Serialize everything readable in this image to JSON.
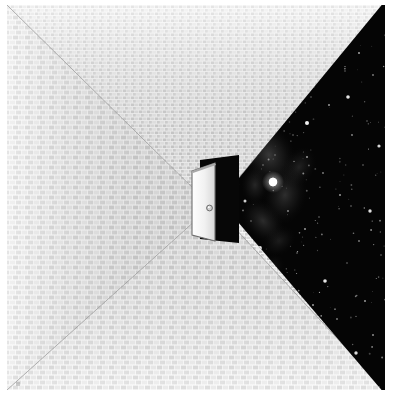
{
  "artwork": {
    "title": "Doorway to Space",
    "description": "A brick-tiled room in one-point perspective with an open door at the vanishing point; a wedge of deep space with a nebula and star field breaks through on the right.",
    "canvas": {
      "width": 395,
      "height": 396,
      "background": "#ffffff"
    },
    "content_bounds": {
      "x": 7,
      "y": 5,
      "width": 378,
      "height": 385
    }
  },
  "palette": {
    "paper_white": "#ffffff",
    "brick_light": "#f4f4f4",
    "brick_mid": "#dcdcdc",
    "brick_dark": "#bdbdbd",
    "mortar": "#fbfbfb",
    "perspective_line": "#9a9a9a",
    "space_black": "#050505",
    "nebula_grey": "#5a5a5a",
    "nebula_dim": "#2c2c2c",
    "star_white": "#ffffff",
    "door_face": "#f3f3f3",
    "door_edge": "#7d7d7d",
    "door_shadow": "#c9c9c9",
    "doorway_dark": "#0a0a0a",
    "knob": "#8d8d8d"
  },
  "geometry": {
    "vanishing_point": {
      "x": 205,
      "y": 196
    },
    "room": {
      "name": "one-point-perspective-room",
      "walls": [
        "ceiling",
        "left-wall",
        "floor",
        "right-wall"
      ],
      "note": "Four trapezoids radiating from the vanishing point, all covered in running-bond brick texture."
    },
    "brick": {
      "unit_width": 6,
      "unit_height": 5,
      "bond": "running",
      "offset": 3
    },
    "space_wedge": {
      "name": "space-wedge",
      "apex": {
        "x": 213,
        "y": 196
      },
      "top_corner": {
        "x": 378,
        "y": 0
      },
      "bottom_corner": {
        "x": 378,
        "y": 385
      },
      "note": "Triangular tear opening onto outer space along the right edge."
    },
    "door": {
      "name": "open-door",
      "panel": {
        "x": 186,
        "y": 166,
        "width": 22,
        "height": 68
      },
      "opening": {
        "x": 193,
        "y": 152,
        "width": 42,
        "height": 90
      },
      "knob": {
        "cx": 203,
        "cy": 203,
        "r": 2.6
      },
      "state": "open"
    }
  },
  "chart_data": {
    "type": "scatter",
    "xlabel": "",
    "ylabel": "",
    "legend": [],
    "grid": false,
    "xlim": [
      0,
      378
    ],
    "ylim": [
      0,
      385
    ],
    "series": [
      {
        "name": "bright-stars",
        "points": [
          {
            "x": 266,
            "y": 177,
            "r": 4.2,
            "b": 1.0
          },
          {
            "x": 300,
            "y": 118,
            "r": 2.0,
            "b": 0.95
          },
          {
            "x": 341,
            "y": 92,
            "r": 1.8,
            "b": 0.9
          },
          {
            "x": 253,
            "y": 243,
            "r": 1.9,
            "b": 0.92
          },
          {
            "x": 318,
            "y": 276,
            "r": 1.8,
            "b": 0.9
          },
          {
            "x": 363,
            "y": 206,
            "r": 1.7,
            "b": 0.88
          },
          {
            "x": 288,
            "y": 330,
            "r": 1.6,
            "b": 0.85
          },
          {
            "x": 349,
            "y": 348,
            "r": 1.7,
            "b": 0.85
          },
          {
            "x": 372,
            "y": 141,
            "r": 1.6,
            "b": 0.85
          },
          {
            "x": 238,
            "y": 196,
            "r": 1.5,
            "b": 0.8
          }
        ]
      },
      {
        "name": "faint-stars",
        "points": [
          {
            "x": 248,
            "y": 132,
            "r": 1.0,
            "b": 0.6
          },
          {
            "x": 261,
            "y": 108,
            "r": 0.9,
            "b": 0.55
          },
          {
            "x": 277,
            "y": 86,
            "r": 1.1,
            "b": 0.65
          },
          {
            "x": 292,
            "y": 62,
            "r": 0.9,
            "b": 0.5
          },
          {
            "x": 311,
            "y": 44,
            "r": 1.0,
            "b": 0.6
          },
          {
            "x": 330,
            "y": 24,
            "r": 0.9,
            "b": 0.55
          },
          {
            "x": 352,
            "y": 48,
            "r": 1.1,
            "b": 0.6
          },
          {
            "x": 366,
            "y": 70,
            "r": 0.9,
            "b": 0.5
          },
          {
            "x": 322,
            "y": 100,
            "r": 1.0,
            "b": 0.6
          },
          {
            "x": 345,
            "y": 130,
            "r": 0.9,
            "b": 0.55
          },
          {
            "x": 300,
            "y": 152,
            "r": 1.0,
            "b": 0.6
          },
          {
            "x": 316,
            "y": 168,
            "r": 0.9,
            "b": 0.5
          },
          {
            "x": 333,
            "y": 190,
            "r": 1.0,
            "b": 0.6
          },
          {
            "x": 281,
            "y": 206,
            "r": 0.9,
            "b": 0.55
          },
          {
            "x": 298,
            "y": 224,
            "r": 1.0,
            "b": 0.6
          },
          {
            "x": 352,
            "y": 236,
            "r": 0.9,
            "b": 0.5
          },
          {
            "x": 262,
            "y": 266,
            "r": 1.0,
            "b": 0.6
          },
          {
            "x": 284,
            "y": 284,
            "r": 0.9,
            "b": 0.55
          },
          {
            "x": 306,
            "y": 300,
            "r": 1.0,
            "b": 0.6
          },
          {
            "x": 330,
            "y": 314,
            "r": 0.9,
            "b": 0.5
          },
          {
            "x": 358,
            "y": 296,
            "r": 1.0,
            "b": 0.6
          },
          {
            "x": 270,
            "y": 318,
            "r": 0.9,
            "b": 0.5
          },
          {
            "x": 300,
            "y": 356,
            "r": 1.0,
            "b": 0.6
          },
          {
            "x": 324,
            "y": 372,
            "r": 0.9,
            "b": 0.5
          },
          {
            "x": 366,
            "y": 330,
            "r": 1.0,
            "b": 0.55
          },
          {
            "x": 244,
            "y": 216,
            "r": 0.8,
            "b": 0.45
          },
          {
            "x": 256,
            "y": 160,
            "r": 0.8,
            "b": 0.45
          },
          {
            "x": 290,
            "y": 248,
            "r": 0.8,
            "b": 0.45
          },
          {
            "x": 340,
            "y": 258,
            "r": 0.8,
            "b": 0.45
          },
          {
            "x": 312,
            "y": 212,
            "r": 0.8,
            "b": 0.45
          },
          {
            "x": 374,
            "y": 250,
            "r": 0.8,
            "b": 0.45
          },
          {
            "x": 356,
            "y": 160,
            "r": 0.8,
            "b": 0.45
          },
          {
            "x": 286,
            "y": 130,
            "r": 0.8,
            "b": 0.45
          },
          {
            "x": 248,
            "y": 290,
            "r": 0.8,
            "b": 0.45
          },
          {
            "x": 318,
            "y": 342,
            "r": 0.8,
            "b": 0.45
          },
          {
            "x": 372,
            "y": 382,
            "r": 0.8,
            "b": 0.4
          },
          {
            "x": 338,
            "y": 66,
            "r": 0.8,
            "b": 0.4
          },
          {
            "x": 304,
            "y": 92,
            "r": 0.8,
            "b": 0.4
          },
          {
            "x": 268,
            "y": 150,
            "r": 0.8,
            "b": 0.4
          },
          {
            "x": 360,
            "y": 116,
            "r": 0.8,
            "b": 0.4
          }
        ]
      }
    ],
    "nebula_blobs": [
      {
        "cx": 262,
        "cy": 150,
        "rx": 26,
        "ry": 34,
        "rot": -22,
        "opacity": 0.4
      },
      {
        "cx": 278,
        "cy": 190,
        "rx": 22,
        "ry": 30,
        "rot": 12,
        "opacity": 0.32
      },
      {
        "cx": 256,
        "cy": 216,
        "rx": 18,
        "ry": 26,
        "rot": -40,
        "opacity": 0.3
      },
      {
        "cx": 292,
        "cy": 162,
        "rx": 16,
        "ry": 22,
        "rot": 30,
        "opacity": 0.22
      },
      {
        "cx": 248,
        "cy": 180,
        "rx": 14,
        "ry": 20,
        "rot": 0,
        "opacity": 0.26
      },
      {
        "cx": 272,
        "cy": 236,
        "rx": 14,
        "ry": 18,
        "rot": 55,
        "opacity": 0.18
      }
    ]
  }
}
